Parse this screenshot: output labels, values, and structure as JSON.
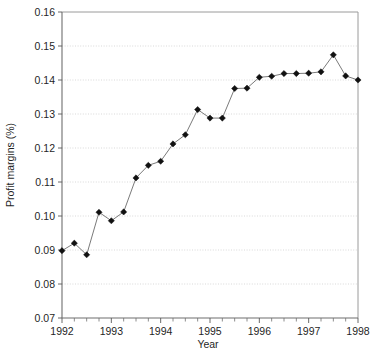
{
  "chart_data": {
    "type": "line",
    "title": "",
    "xlabel": "Year",
    "ylabel": "Profit margins (%)",
    "xlim": [
      1992.0,
      1998.0
    ],
    "ylim": [
      0.07,
      0.16
    ],
    "grid": true,
    "legend": null,
    "marker": "diamond",
    "marker_color": "#111111",
    "line_color": "#6b6b6b",
    "gridline_color": "#cfcfcf",
    "background_color": "#ffffff",
    "x_tick_labels": [
      "1992",
      "1993",
      "1994",
      "1995",
      "1996",
      "1997",
      "1998"
    ],
    "x_tick_values": [
      1992,
      1993,
      1994,
      1995,
      1996,
      1997,
      1998
    ],
    "x_minor_tick_interval": 0.25,
    "y_tick_labels": [
      "0.16",
      "0.15",
      "0.14",
      "0.13",
      "0.12",
      "0.11",
      "0.10",
      "0.09",
      "0.08",
      "0.07"
    ],
    "y_tick_values": [
      0.16,
      0.15,
      0.14,
      0.13,
      0.12,
      0.11,
      0.1,
      0.09,
      0.08,
      0.07
    ],
    "x": [
      1992.0,
      1992.25,
      1992.5,
      1992.75,
      1993.0,
      1993.25,
      1993.5,
      1993.75,
      1994.0,
      1994.25,
      1994.5,
      1994.75,
      1995.0,
      1995.25,
      1995.5,
      1995.75,
      1996.0,
      1996.25,
      1996.5,
      1996.75,
      1997.0,
      1997.25,
      1997.5,
      1997.75,
      1998.0
    ],
    "values": [
      0.0898,
      0.092,
      0.0886,
      0.1011,
      0.0986,
      0.1012,
      0.1112,
      0.1149,
      0.1161,
      0.1212,
      0.1239,
      0.1313,
      0.1288,
      0.1288,
      0.1375,
      0.1376,
      0.1408,
      0.1411,
      0.1419,
      0.1419,
      0.142,
      0.1424,
      0.1474,
      0.1412,
      0.14
    ],
    "series": [
      {
        "name": "Profit margins",
        "values": [
          0.0898,
          0.092,
          0.0886,
          0.1011,
          0.0986,
          0.1012,
          0.1112,
          0.1149,
          0.1161,
          0.1212,
          0.1239,
          0.1313,
          0.1288,
          0.1288,
          0.1375,
          0.1376,
          0.1408,
          0.1411,
          0.1419,
          0.1419,
          0.142,
          0.1424,
          0.1474,
          0.1412,
          0.14
        ]
      }
    ]
  }
}
